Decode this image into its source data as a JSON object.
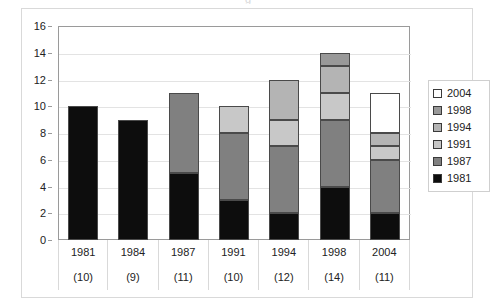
{
  "figure": {
    "top_glyph": "g"
  },
  "chart_data": {
    "type": "bar",
    "stacked": true,
    "title": "",
    "xlabel": "",
    "ylabel": "",
    "ylim": [
      0,
      16
    ],
    "ytick_step": 2,
    "yticks": [
      0,
      2,
      4,
      6,
      8,
      10,
      12,
      14,
      16
    ],
    "grid": true,
    "legend_position": "right",
    "categories": [
      "1981",
      "1984",
      "1987",
      "1991",
      "1994",
      "1998",
      "2004"
    ],
    "category_totals": [
      10,
      9,
      11,
      10,
      12,
      14,
      11
    ],
    "category_total_labels": [
      "(10)",
      "(9)",
      "(11)",
      "(10)",
      "(12)",
      "(14)",
      "(11)"
    ],
    "series": [
      {
        "name": "1981",
        "color": "#0d0d0d",
        "values": [
          10,
          9,
          5,
          3,
          2,
          4,
          2
        ]
      },
      {
        "name": "1987",
        "color": "#808080",
        "values": [
          0,
          0,
          6,
          5,
          5,
          5,
          4
        ]
      },
      {
        "name": "1991",
        "color": "#c8c8c8",
        "values": [
          0,
          0,
          0,
          2,
          2,
          2,
          1
        ]
      },
      {
        "name": "1994",
        "color": "#b4b4b4",
        "values": [
          0,
          0,
          0,
          0,
          3,
          2,
          1
        ]
      },
      {
        "name": "1998",
        "color": "#999999",
        "values": [
          0,
          0,
          0,
          0,
          0,
          1,
          0
        ]
      },
      {
        "name": "2004",
        "color": "#ffffff",
        "values": [
          0,
          0,
          0,
          0,
          0,
          0,
          3
        ]
      }
    ],
    "legend_order": [
      "2004",
      "1998",
      "1994",
      "1991",
      "1987",
      "1981"
    ]
  },
  "colors": {
    "plot_border": "#9a9a9a",
    "gridline": "#e3e3e3",
    "bar_outline": "#4a4a4a",
    "frame": "#d9d9d9",
    "text": "#222222"
  }
}
